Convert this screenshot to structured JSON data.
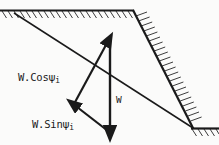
{
  "figure": {
    "background_color": "#fbfbfa",
    "ink_color": "#1a1a1a",
    "width": 219,
    "height": 145,
    "labels": {
      "normal_component": "W.Cos",
      "normal_component_symbol": "ψ",
      "normal_component_subscript": "i",
      "tangential_component": "W.Sin",
      "tangential_component_symbol": "ψ",
      "tangential_component_subscript": "i",
      "weight": "W"
    },
    "geometry": {
      "ground_surface_y": 10,
      "crest_x": 133,
      "toe_x": 193,
      "toe_y": 128,
      "failure_plane_start": [
        14,
        13
      ],
      "failure_plane_end": [
        193,
        128
      ],
      "weight_vector_start": [
        110,
        38
      ],
      "weight_vector_end": [
        110,
        132
      ],
      "normal_vector_start": [
        74,
        103
      ],
      "normal_vector_end": [
        108,
        40
      ],
      "tangential_vector_start": [
        108,
        131
      ],
      "tangential_vector_end": [
        73,
        105
      ]
    },
    "hatching": {
      "crest_surface": "hatch-down-right",
      "slope_face": "hatch-perpendicular",
      "toe_surface": "hatch-down-right"
    }
  }
}
